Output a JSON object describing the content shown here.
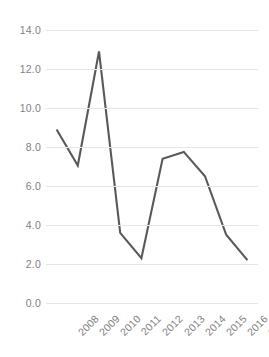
{
  "chart_data": {
    "type": "line",
    "title": "",
    "subtitle": "",
    "xlabel": "",
    "ylabel": "",
    "categories": [
      "2008",
      "2009",
      "2010",
      "2011",
      "2012",
      "2013",
      "2014",
      "2015",
      "2016",
      "2017"
    ],
    "values": [
      8.9,
      7.05,
      12.9,
      3.6,
      2.3,
      7.4,
      7.75,
      6.5,
      3.5,
      2.2
    ],
    "series": [
      {
        "name": "Series 1",
        "values": [
          8.9,
          7.05,
          12.9,
          3.6,
          2.3,
          7.4,
          7.75,
          6.5,
          3.5,
          2.2
        ]
      }
    ],
    "ylim": [
      0.0,
      14.0
    ],
    "ytick_step": 2.0,
    "ytick_labels": [
      "14.0",
      "12.0",
      "10.0",
      "8.0",
      "6.0",
      "4.0",
      "2.0",
      "0.0"
    ],
    "ytick_values": [
      14.0,
      12.0,
      10.0,
      8.0,
      6.0,
      4.0,
      2.0,
      0.0
    ],
    "grid": true,
    "grid_axis": "y",
    "legend": false,
    "legend_position": "none",
    "markers": false,
    "xtick_rotation": -45,
    "colors": {
      "line": "#595959",
      "gridline": "#e6e6e6",
      "tick_label": "#7f7f7f",
      "background": "#ffffff"
    },
    "line_width": 2.1,
    "annotations": []
  }
}
